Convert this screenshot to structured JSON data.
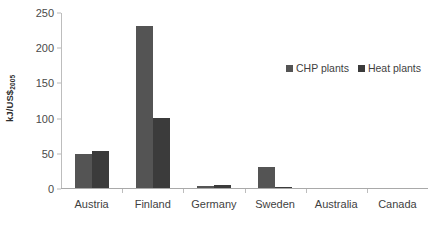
{
  "chart_data": {
    "type": "bar",
    "title": "",
    "subtitle": "",
    "xlabel": "",
    "ylabel": "kJ/US$2005",
    "ylabel_main": "kJ/US$",
    "ylabel_sub": "2005",
    "categories": [
      "Austria",
      "Finland",
      "Germany",
      "Sweden",
      "Australia",
      "Canada"
    ],
    "series": [
      {
        "name": "CHP plants",
        "color": "#545454",
        "values": [
          49,
          230,
          3,
          30,
          0,
          0
        ]
      },
      {
        "name": "Heat plants",
        "color": "#3b3b3b",
        "values": [
          52,
          99,
          4,
          2,
          0,
          0
        ]
      }
    ],
    "ylim": [
      0,
      250
    ],
    "ytick_labels": [
      "0",
      "50",
      "100",
      "150",
      "200",
      "250"
    ],
    "ytick_values": [
      0,
      50,
      100,
      150,
      200,
      250
    ],
    "grid": false,
    "legend_position": "upper-right-inside"
  }
}
